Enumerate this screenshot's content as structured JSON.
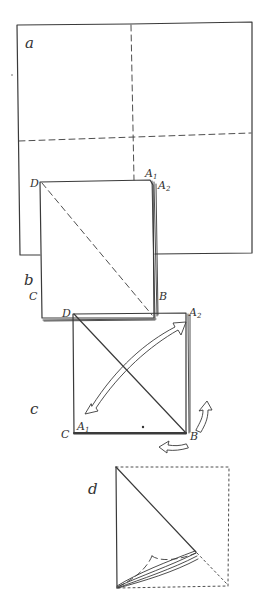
{
  "panels": {
    "a": {
      "label": "a"
    },
    "b": {
      "label": "b",
      "corners": {
        "D": "D",
        "A1": "A",
        "A1_sub": "1",
        "A2": "A",
        "A2_sub": "2",
        "C": "C",
        "B": "B"
      }
    },
    "c": {
      "label": "c",
      "corners": {
        "D": "D",
        "A2": "A",
        "A2_sub": "2",
        "A1": "A",
        "A1_sub": "1",
        "C": "C",
        "B": "B"
      }
    },
    "d": {
      "label": "d"
    }
  },
  "colors": {
    "ink": "#3a3a3a",
    "background": "#ffffff"
  }
}
